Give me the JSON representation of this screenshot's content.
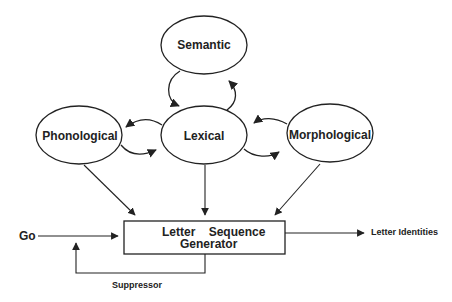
{
  "diagram": {
    "nodes": {
      "semantic": "Semantic",
      "phonological": "Phonological",
      "lexical": "Lexical",
      "morphological": "Morphological"
    },
    "generator": {
      "line1": "Letter Sequence",
      "line2": "Generator"
    },
    "inputs": {
      "go": "Go"
    },
    "outputs": {
      "letter_identities": "Letter Identities"
    },
    "feedback": {
      "suppressor": "Suppressor"
    },
    "colors": {
      "stroke": "#222222",
      "text": "#222222",
      "background": "#ffffff"
    }
  }
}
